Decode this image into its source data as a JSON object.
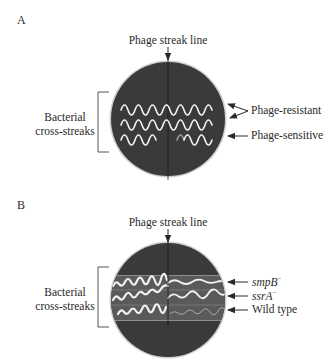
{
  "panel_a": {
    "letter": "A",
    "top_label": "Phage streak line",
    "left_label_line1": "Bacterial",
    "left_label_line2": "cross-streaks",
    "right_labels": {
      "resistant": "Phage-resistant",
      "sensitive": "Phage-sensitive"
    }
  },
  "panel_b": {
    "letter": "B",
    "top_label": "Phage streak line",
    "left_label_line1": "Bacterial",
    "left_label_line2": "cross-streaks",
    "right_labels": {
      "smpb": "smpB",
      "smpb_sup": "−",
      "ssra": "ssrA",
      "ssra_sup": "−",
      "wild": "Wild type"
    }
  },
  "colors": {
    "plate": "#3a3a3a",
    "plate_rim": "#bdbdbd",
    "streak": "#f2f2f2",
    "streak_dim": "#9a9a9a",
    "text": "#2a2a2a"
  }
}
